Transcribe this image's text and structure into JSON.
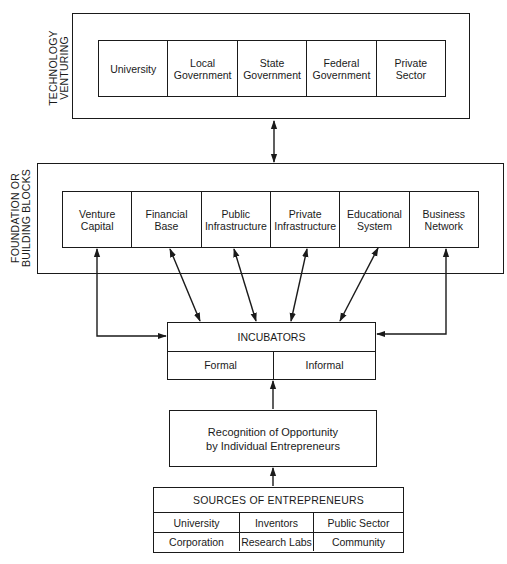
{
  "diagram": {
    "technology_venturing": {
      "label": "TECHNOLOGY\nVENTURING",
      "items": [
        {
          "label": "University"
        },
        {
          "label": "Local\nGovernment"
        },
        {
          "label": "State\nGovernment"
        },
        {
          "label": "Federal\nGovernment"
        },
        {
          "label": "Private\nSector"
        }
      ]
    },
    "foundation": {
      "label": "FOUNDATION OR\nBUILDING BLOCKS",
      "items": [
        {
          "label": "Venture\nCapital"
        },
        {
          "label": "Financial\nBase"
        },
        {
          "label": "Public\nInfrastructure"
        },
        {
          "label": "Private\nInfrastructure"
        },
        {
          "label": "Educational\nSystem"
        },
        {
          "label": "Business\nNetwork"
        }
      ]
    },
    "incubators": {
      "title": "INCUBATORS",
      "types": [
        {
          "label": "Formal"
        },
        {
          "label": "Informal"
        }
      ]
    },
    "recognition": {
      "label": "Recognition of Opportunity\nby Individual Entrepreneurs"
    },
    "sources": {
      "title": "SOURCES OF ENTREPRENEURS",
      "rows": [
        [
          "University",
          "Inventors",
          "Public Sector"
        ],
        [
          "Corporation",
          "Research Labs",
          "Community"
        ]
      ]
    },
    "colors": {
      "line": "#1a1a1a",
      "background": "#ffffff"
    }
  }
}
